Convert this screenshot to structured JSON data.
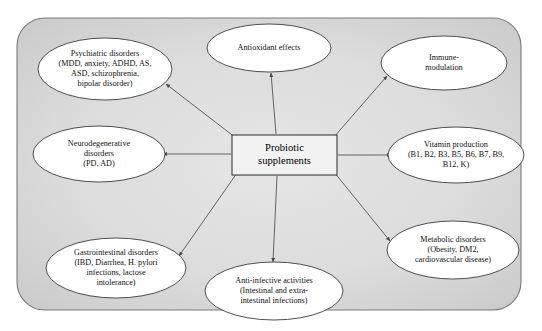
{
  "diagram": {
    "center": {
      "name": "probiotic-supplements",
      "lines": [
        "Probiotic",
        "supplements"
      ],
      "box": {
        "x": 232,
        "y": 135,
        "w": 105,
        "h": 40
      }
    },
    "panel": {
      "x": 17,
      "y": 18,
      "w": 504,
      "h": 292,
      "radius": 28,
      "fill_outer": "#cfcfcf",
      "fill_inner": "#e2e2e2",
      "stroke": "#7a7a7a"
    },
    "colors": {
      "ellipse_fill": "#ffffff",
      "ellipse_stroke": "#3b3b3b",
      "connector": "#555555",
      "center_fill": "#f2f2f2",
      "center_stroke": "#2b2b2b",
      "text": "#111111"
    },
    "nodes": [
      {
        "name": "psychiatric-disorders",
        "cx": 105,
        "cy": 69,
        "rx": 67,
        "ry": 31,
        "lines": [
          "Psychiatric disorders",
          "(MDD, anxiety, ADHD, AS,",
          "ASD, schizophrenia,",
          "bipolar disorder)"
        ],
        "arrow_x": 166,
        "arrow_y": 84,
        "from_x": 236,
        "from_y": 138
      },
      {
        "name": "antioxidant-effects",
        "cx": 269,
        "cy": 48,
        "rx": 62,
        "ry": 24,
        "lines": [
          "Antioxidant effects"
        ],
        "arrow_x": 271,
        "arrow_y": 73,
        "from_x": 276,
        "from_y": 134
      },
      {
        "name": "immune-modulation",
        "cx": 444,
        "cy": 63,
        "rx": 63,
        "ry": 27,
        "lines": [
          "Immune-",
          "modulation"
        ],
        "arrow_x": 387,
        "arrow_y": 76,
        "from_x": 334,
        "from_y": 137
      },
      {
        "name": "neurodegenerative-disorders",
        "cx": 99,
        "cy": 154,
        "rx": 66,
        "ry": 28,
        "lines": [
          "Neurodegenerative",
          "disorders",
          "(PD, AD)"
        ],
        "arrow_x": 163,
        "arrow_y": 154,
        "from_x": 231,
        "from_y": 154
      },
      {
        "name": "vitamin-production",
        "cx": 456,
        "cy": 155,
        "rx": 68,
        "ry": 28,
        "lines": [
          "Vitamin production",
          "(B1, B2, B3, B5, B6, B7, B9,",
          "B12, K)"
        ],
        "arrow_x": 391,
        "arrow_y": 155,
        "from_x": 338,
        "from_y": 155
      },
      {
        "name": "gastrointestinal-disorders",
        "cx": 116,
        "cy": 268,
        "rx": 70,
        "ry": 30,
        "lines": [
          "Gastrointestinal disorders",
          "(IBD, Diarrhea, H. pylori",
          "infections, lactose",
          "intolerance)"
        ],
        "arrow_x": 179,
        "arrow_y": 256,
        "from_x": 237,
        "from_y": 173
      },
      {
        "name": "anti-infective-activities",
        "cx": 274,
        "cy": 291,
        "rx": 69,
        "ry": 29,
        "lines": [
          "Anti-infective activities",
          "(Intestinal and extra-",
          "intestinal infections)"
        ],
        "arrow_x": 273,
        "arrow_y": 262,
        "from_x": 277,
        "from_y": 176
      },
      {
        "name": "metabolic-disorders",
        "cx": 453,
        "cy": 250,
        "rx": 66,
        "ry": 29,
        "lines": [
          "Metabolic disorders",
          "(Obesity, DM2,",
          "cardiovascular disease)"
        ],
        "arrow_x": 390,
        "arrow_y": 241,
        "from_x": 334,
        "from_y": 172
      }
    ]
  }
}
